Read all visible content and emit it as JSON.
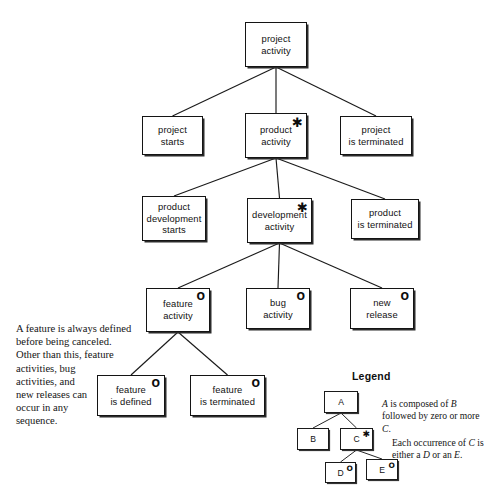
{
  "diagram": {
    "background_color": "#ffffff",
    "line_color": "#1a1a1a",
    "markers": {
      "iteration": "*",
      "optional": "O"
    },
    "nodes": [
      {
        "id": "project-activity",
        "label": "project\nactivity",
        "marker": "",
        "x": 245,
        "y": 22,
        "w": 62,
        "h": 45
      },
      {
        "id": "project-starts",
        "label": "project\nstarts",
        "marker": "",
        "x": 142,
        "y": 116,
        "w": 61,
        "h": 39
      },
      {
        "id": "product-activity",
        "label": "product\nactivity",
        "marker": "*",
        "x": 245,
        "y": 113,
        "w": 62,
        "h": 45
      },
      {
        "id": "project-is-terminated",
        "label": "project\nis terminated",
        "marker": "",
        "x": 340,
        "y": 116,
        "w": 72,
        "h": 39
      },
      {
        "id": "product-development-starts",
        "label": "product\ndevelopment\nstarts",
        "marker": "",
        "x": 142,
        "y": 196,
        "w": 64,
        "h": 45
      },
      {
        "id": "development-activity",
        "label": "development\nactivity",
        "marker": "*",
        "x": 247,
        "y": 198,
        "w": 65,
        "h": 45
      },
      {
        "id": "product-is-terminated",
        "label": "product\nis terminated",
        "marker": "",
        "x": 351,
        "y": 199,
        "w": 68,
        "h": 40
      },
      {
        "id": "feature-activity",
        "label": "feature\nactivity",
        "marker": "O",
        "x": 146,
        "y": 288,
        "w": 64,
        "h": 44
      },
      {
        "id": "bug-activity",
        "label": "bug\nactivity",
        "marker": "O",
        "x": 246,
        "y": 288,
        "w": 64,
        "h": 41
      },
      {
        "id": "new-release",
        "label": "new\nrelease",
        "marker": "O",
        "x": 350,
        "y": 288,
        "w": 64,
        "h": 41
      },
      {
        "id": "feature-is-defined",
        "label": "feature\nis defined",
        "marker": "O",
        "x": 97,
        "y": 375,
        "w": 68,
        "h": 41
      },
      {
        "id": "feature-is-terminated",
        "label": "feature\nis terminated",
        "marker": "O",
        "x": 190,
        "y": 375,
        "w": 75,
        "h": 41
      }
    ],
    "edges": [
      {
        "from": "project-activity",
        "to": "project-starts"
      },
      {
        "from": "project-activity",
        "to": "product-activity"
      },
      {
        "from": "project-activity",
        "to": "project-is-terminated"
      },
      {
        "from": "product-activity",
        "to": "product-development-starts"
      },
      {
        "from": "product-activity",
        "to": "development-activity"
      },
      {
        "from": "product-activity",
        "to": "product-is-terminated"
      },
      {
        "from": "development-activity",
        "to": "feature-activity"
      },
      {
        "from": "development-activity",
        "to": "bug-activity"
      },
      {
        "from": "development-activity",
        "to": "new-release"
      },
      {
        "from": "feature-activity",
        "to": "feature-is-defined"
      },
      {
        "from": "feature-activity",
        "to": "feature-is-terminated"
      }
    ]
  },
  "note": {
    "text": "A feature is always defined\nbefore being canceled.\nOther than this, feature\nactivities, bug\nactivities, and\nnew releases can\noccur in any\nsequence."
  },
  "legend": {
    "title": "Legend",
    "nodes": [
      {
        "id": "legend-a",
        "label": "A",
        "marker": "",
        "x": 324,
        "y": 391,
        "w": 34,
        "h": 22
      },
      {
        "id": "legend-b",
        "label": "B",
        "marker": "",
        "x": 297,
        "y": 428,
        "w": 32,
        "h": 22
      },
      {
        "id": "legend-c",
        "label": "C",
        "marker": "*",
        "x": 340,
        "y": 428,
        "w": 33,
        "h": 22
      },
      {
        "id": "legend-d",
        "label": "D",
        "marker": "O",
        "x": 325,
        "y": 462,
        "w": 31,
        "h": 21
      },
      {
        "id": "legend-e",
        "label": "E",
        "marker": "O",
        "x": 366,
        "y": 459,
        "w": 32,
        "h": 21
      }
    ],
    "edges": [
      {
        "from": "legend-a",
        "to": "legend-b"
      },
      {
        "from": "legend-a",
        "to": "legend-c"
      },
      {
        "from": "legend-c",
        "to": "legend-d"
      },
      {
        "from": "legend-c",
        "to": "legend-e"
      }
    ],
    "text_1_html": "<i>A</i> is composed of <i>B</i> followed by zero or more <i>C</i>.",
    "text_2_html": "Each occurrence of <i>C</i> is either a <i>D</i> or an <i>E</i>."
  }
}
